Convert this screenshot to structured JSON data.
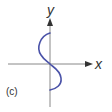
{
  "figure": {
    "panel_label": "(c)",
    "axes": {
      "x_label": "x",
      "y_label": "y",
      "axis_color": "#888888",
      "arrow_color": "#333333"
    },
    "curve": {
      "description": "S-shaped curve through origin: bulges left above x-axis, bulges right below x-axis",
      "color": "#4a52a8"
    }
  }
}
